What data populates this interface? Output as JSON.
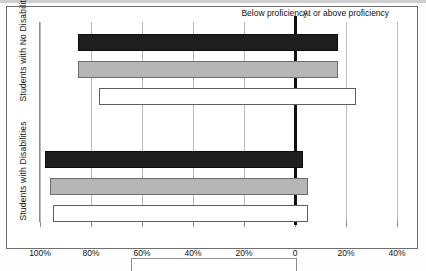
{
  "chart_data": {
    "type": "bar",
    "orientation": "horizontal",
    "layout": "diverging",
    "title": "",
    "xlabel": "",
    "ylabel": "",
    "headers": {
      "left": "Below proficiency",
      "right": "At or above proficiency"
    },
    "xticks": [
      "100%",
      "80%",
      "60%",
      "40%",
      "20%",
      "0",
      "20%",
      "40%"
    ],
    "xtick_values": [
      -100,
      -80,
      -60,
      -40,
      -20,
      0,
      20,
      40
    ],
    "xlim": [
      -108,
      46
    ],
    "grid": true,
    "legend_position": "none",
    "groups": [
      {
        "name": "Students with No Disabilities",
        "bars": [
          {
            "series": "series-1",
            "fill": "black",
            "below": 85,
            "at_or_above": 17
          },
          {
            "series": "series-2",
            "fill": "gray",
            "below": 85,
            "at_or_above": 17
          },
          {
            "series": "series-3",
            "fill": "white",
            "below": 77,
            "at_or_above": 24
          }
        ]
      },
      {
        "name": "Students with Disabilities",
        "bars": [
          {
            "series": "series-1",
            "fill": "black",
            "below": 98,
            "at_or_above": 3
          },
          {
            "series": "series-2",
            "fill": "gray",
            "below": 96,
            "at_or_above": 5
          },
          {
            "series": "series-3",
            "fill": "white",
            "below": 95,
            "at_or_above": 5
          }
        ]
      }
    ],
    "colors": {
      "black": "#1e1e1e",
      "gray": "#b6b6b6",
      "white": "#ffffff",
      "gridline": "#b9b9b9",
      "zeroline": "#111111",
      "frame": "#6f6f6f"
    }
  }
}
